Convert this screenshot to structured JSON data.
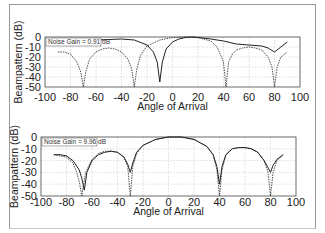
{
  "chart_data": [
    {
      "type": "line",
      "title": "",
      "annotation": "Noise Gain = 0.91 dB",
      "xlabel": "Angle of Arrival",
      "ylabel": "Beampattern (dB)",
      "xlim": [
        -100,
        100
      ],
      "ylim": [
        -50,
        0
      ],
      "xticks": [
        -100,
        -80,
        -60,
        -40,
        -20,
        0,
        20,
        40,
        60,
        80,
        100
      ],
      "yticks": [
        0,
        -10,
        -20,
        -30,
        -40,
        -50
      ],
      "grid": true,
      "series": [
        {
          "name": "solid",
          "style": "solid",
          "x": [
            -90,
            -80,
            -70,
            -60,
            -50,
            -40,
            -30,
            -20,
            -15,
            -12,
            -10,
            -8,
            -5,
            0,
            5,
            10,
            15,
            20,
            30,
            40,
            50,
            60,
            70,
            75,
            80,
            85,
            90
          ],
          "y": [
            -5,
            -4,
            -3.5,
            -3,
            -2.5,
            -2,
            -3,
            -8,
            -15,
            -25,
            -45,
            -25,
            -12,
            -5,
            -2,
            -0.5,
            0,
            -0.5,
            -2,
            -4,
            -7,
            -8,
            -9,
            -11,
            -15,
            -10,
            -5
          ]
        },
        {
          "name": "dashed",
          "style": "dashed",
          "x": [
            -90,
            -85,
            -80,
            -75,
            -72,
            -70,
            -68,
            -65,
            -60,
            -55,
            -50,
            -45,
            -40,
            -35,
            -32,
            -30,
            -28,
            -25,
            -20,
            -10,
            0,
            10,
            15,
            20,
            30,
            35,
            40,
            42,
            44,
            47,
            50,
            55,
            60,
            65,
            70,
            75,
            78,
            80,
            82,
            85,
            90
          ],
          "y": [
            -15,
            -15,
            -17,
            -25,
            -35,
            -50,
            -35,
            -22,
            -15,
            -12,
            -11,
            -12,
            -15,
            -22,
            -32,
            -50,
            -32,
            -18,
            -9,
            -3,
            -0.5,
            0,
            0,
            -0.5,
            -4,
            -10,
            -25,
            -50,
            -25,
            -17,
            -13,
            -11,
            -10,
            -11,
            -13,
            -20,
            -30,
            -50,
            -30,
            -20,
            -15
          ]
        }
      ]
    },
    {
      "type": "line",
      "title": "",
      "annotation": "Noise Gain = 9.96 dB",
      "xlabel": "Angle of Arrival",
      "ylabel": "Beampattern (dB)",
      "xlim": [
        -100,
        100
      ],
      "ylim": [
        -50,
        0
      ],
      "xticks": [
        -100,
        -80,
        -60,
        -40,
        -20,
        0,
        20,
        40,
        60,
        80,
        100
      ],
      "yticks": [
        0,
        -10,
        -20,
        -30,
        -40,
        -50
      ],
      "grid": true,
      "series": [
        {
          "name": "solid",
          "style": "solid",
          "x": [
            -90,
            -85,
            -80,
            -75,
            -70,
            -68,
            -66,
            -64,
            -60,
            -55,
            -50,
            -45,
            -40,
            -35,
            -32,
            -30,
            -28,
            -25,
            -20,
            -10,
            0,
            10,
            20,
            30,
            35,
            38,
            40,
            42,
            45,
            50,
            55,
            60,
            65,
            70,
            75,
            78,
            80,
            82,
            85,
            90
          ],
          "y": [
            -15,
            -15,
            -16,
            -20,
            -28,
            -35,
            -45,
            -30,
            -20,
            -15,
            -13,
            -12,
            -13,
            -17,
            -23,
            -30,
            -22,
            -13,
            -7,
            -2,
            0,
            0,
            -2,
            -8,
            -15,
            -25,
            -40,
            -25,
            -15,
            -10,
            -9,
            -9,
            -10,
            -13,
            -20,
            -26,
            -30,
            -24,
            -19,
            -15
          ]
        },
        {
          "name": "dashed",
          "style": "dashed",
          "x": [
            -90,
            -85,
            -80,
            -75,
            -72,
            -70,
            -68,
            -65,
            -60,
            -55,
            -50,
            -45,
            -40,
            -35,
            -32,
            -30,
            -28,
            -25,
            -20,
            -10,
            0,
            10,
            20,
            30,
            35,
            38,
            40,
            42,
            45,
            50,
            55,
            60,
            65,
            70,
            75,
            78,
            80,
            82,
            85,
            90
          ],
          "y": [
            -15,
            -16,
            -17,
            -22,
            -30,
            -38,
            -50,
            -30,
            -19,
            -14,
            -12,
            -12,
            -13,
            -17,
            -25,
            -50,
            -25,
            -14,
            -7,
            -2,
            0,
            0,
            -2,
            -8,
            -15,
            -28,
            -50,
            -28,
            -15,
            -10,
            -9,
            -9,
            -10,
            -13,
            -20,
            -30,
            -50,
            -30,
            -20,
            -15
          ]
        }
      ]
    }
  ]
}
